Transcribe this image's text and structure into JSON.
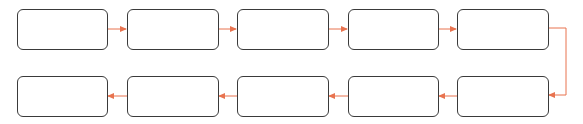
{
  "diagram": {
    "type": "process-flow",
    "layout": "serpentine-2-rows",
    "colors": {
      "box_border": "#3a3a3a",
      "box_fill": "#ffffff",
      "arrow": "#e8734f",
      "background": "#ffffff"
    },
    "nodes": [
      {
        "id": 1,
        "label": "",
        "row": 1
      },
      {
        "id": 2,
        "label": "",
        "row": 1
      },
      {
        "id": 3,
        "label": "",
        "row": 1
      },
      {
        "id": 4,
        "label": "",
        "row": 1
      },
      {
        "id": 5,
        "label": "",
        "row": 1
      },
      {
        "id": 6,
        "label": "",
        "row": 2
      },
      {
        "id": 7,
        "label": "",
        "row": 2
      },
      {
        "id": 8,
        "label": "",
        "row": 2
      },
      {
        "id": 9,
        "label": "",
        "row": 2
      },
      {
        "id": 10,
        "label": "",
        "row": 2
      }
    ],
    "edges": [
      {
        "from": 1,
        "to": 2
      },
      {
        "from": 2,
        "to": 3
      },
      {
        "from": 3,
        "to": 4
      },
      {
        "from": 4,
        "to": 5
      },
      {
        "from": 5,
        "to": 6
      },
      {
        "from": 6,
        "to": 7
      },
      {
        "from": 7,
        "to": 8
      },
      {
        "from": 8,
        "to": 9
      },
      {
        "from": 9,
        "to": 10
      }
    ]
  }
}
